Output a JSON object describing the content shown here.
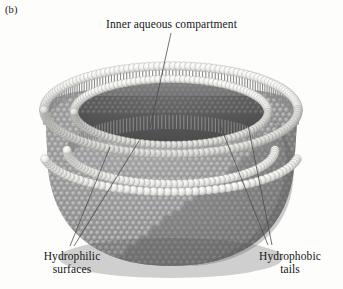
{
  "figure": {
    "panel_label": "(b)",
    "background_color": "#fdfdfc",
    "text_color": "#161616"
  },
  "labels": {
    "title": "Inner aqueous compartment",
    "hydrophilic": {
      "line1": "Hydrophilic",
      "line2": "surfaces"
    },
    "hydrophobic": {
      "line1": "Hydrophobic",
      "line2": "tails"
    }
  },
  "leader_lines": [
    {
      "name": "leader-inner-compartment",
      "x1": 171,
      "y1": 33,
      "x2": 150,
      "y2": 128
    },
    {
      "name": "leader-hydrophilic-outer",
      "x1": 70,
      "y1": 246,
      "x2": 110,
      "y2": 147
    },
    {
      "name": "leader-hydrophilic-inner",
      "x1": 74,
      "y1": 246,
      "x2": 139,
      "y2": 141
    },
    {
      "name": "leader-hydrophobic-upper",
      "x1": 268,
      "y1": 245,
      "x2": 220,
      "y2": 125
    },
    {
      "name": "leader-hydrophobic-lower",
      "x1": 272,
      "y1": 245,
      "x2": 247,
      "y2": 120
    }
  ],
  "vesicle": {
    "head_group_color": "#e9e9e6",
    "tail_color": "#8e8e8e",
    "outer_surface_color": "#9a9a9a",
    "inner_cavity_color": "#5c5c5c",
    "shadow_color": "#6f6f6f",
    "rim_ring_count": 2,
    "bead_rows": {
      "outer_leaflet_ring": "light spheres along outer cut rim",
      "inner_leaflet_ring": "light spheres along inner cut rim"
    }
  }
}
